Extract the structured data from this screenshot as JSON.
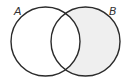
{
  "diagram": {
    "type": "venn",
    "sets": [
      {
        "label": "A",
        "cx": 45.5,
        "cy": 41.5,
        "r": 34.5
      },
      {
        "label": "B",
        "cx": 85.5,
        "cy": 41.5,
        "r": 34.5
      }
    ],
    "shaded_region": "B minus A",
    "colors": {
      "stroke": "#2b2b2b",
      "shade": "#efefef",
      "background": "#ffffff"
    }
  }
}
